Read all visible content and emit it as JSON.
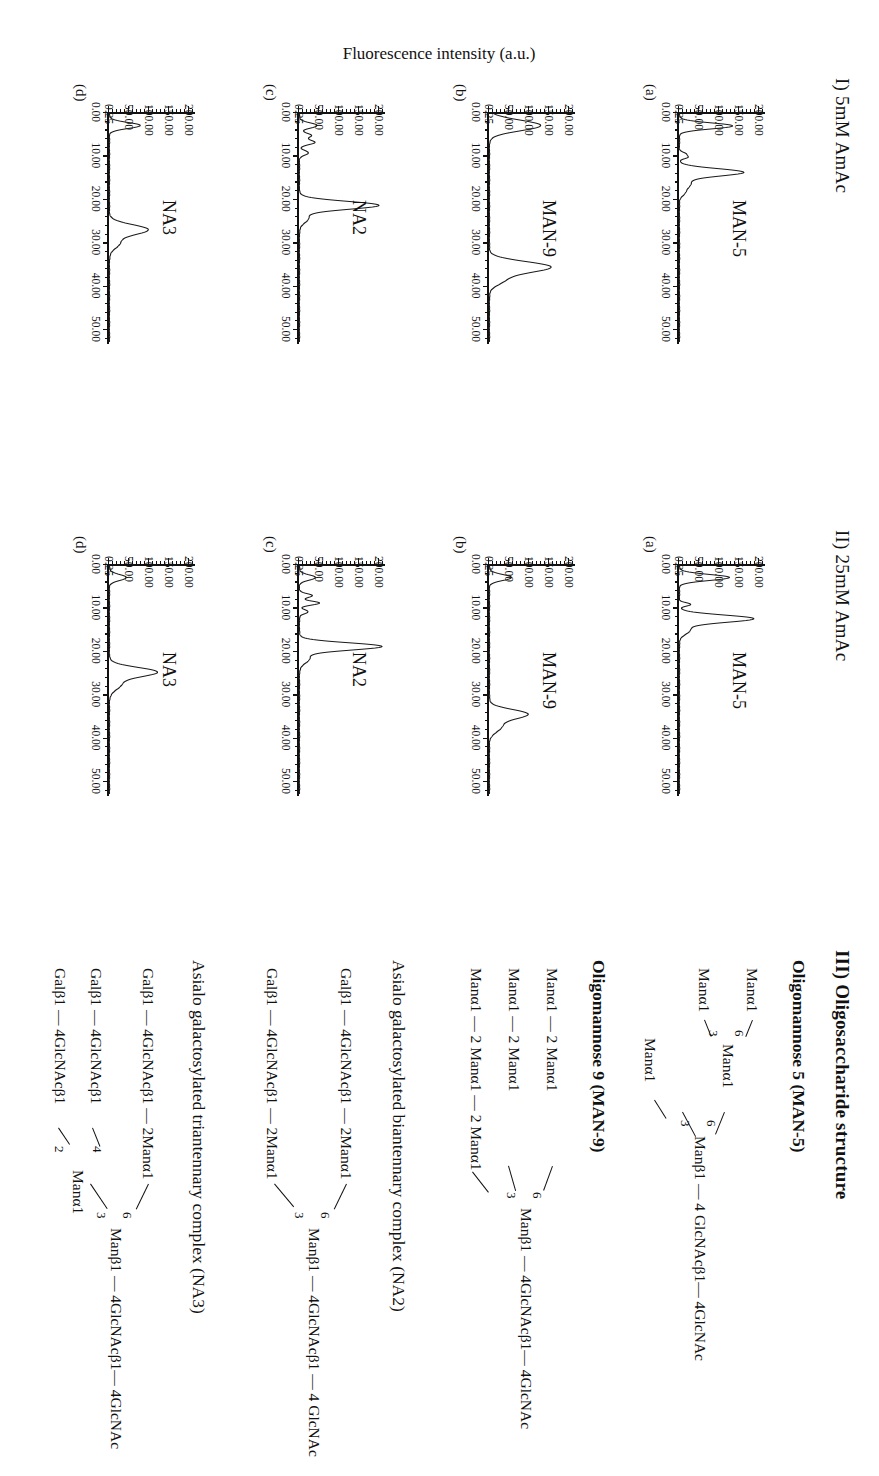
{
  "figure": {
    "y_axis_title": "Fluorescence intensity (a.u.)",
    "section_I_title": "I) 5mM AmAc",
    "section_II_title": "II) 25mM AmAc",
    "section_III_title": "III) Oligosaccharide structure"
  },
  "axes": {
    "y_ticks": [
      "0.25",
      "50.00",
      "100.00",
      "150.00",
      "200.00"
    ],
    "x_ticks": [
      "0.00",
      "10.00",
      "20.00",
      "30.00",
      "40.00",
      "50.00"
    ],
    "panel_letters": [
      "(a)",
      "(b)",
      "(c)",
      "(d)"
    ]
  },
  "chart_data": {
    "type": "line",
    "xlabel": "Retention time (min)",
    "ylabel": "Fluorescence intensity (a.u.)",
    "xlim": [
      0,
      53
    ],
    "ylim": [
      0.25,
      215
    ],
    "grid": false,
    "legend": "none",
    "panels": [
      {
        "id": "I-a",
        "section": "I) 5mM AmAc",
        "letter": "(a)",
        "sample": "MAN-5",
        "peaks": [
          {
            "time": 3.2,
            "height": 133,
            "width": 0.9
          },
          {
            "time": 9.6,
            "height": 14,
            "width": 0.5
          },
          {
            "time": 10.4,
            "height": 20,
            "width": 0.5
          },
          {
            "time": 13.9,
            "height": 160,
            "width": 1.1
          },
          {
            "time": 16.6,
            "height": 28,
            "width": 1.4
          },
          {
            "time": 18.7,
            "height": 10,
            "width": 1.0
          }
        ]
      },
      {
        "id": "I-b",
        "section": "I) 5mM AmAc",
        "letter": "(b)",
        "sample": "MAN-9",
        "peaks": [
          {
            "time": 3.1,
            "height": 128,
            "width": 1.6
          },
          {
            "time": 35.7,
            "height": 152,
            "width": 1.6
          },
          {
            "time": 38.6,
            "height": 36,
            "width": 1.6
          }
        ]
      },
      {
        "id": "I-c",
        "section": "I) 5mM AmAc",
        "letter": "(c)",
        "sample": "NA2",
        "peaks": [
          {
            "time": 3.1,
            "height": 44,
            "width": 0.8
          },
          {
            "time": 5.4,
            "height": 30,
            "width": 0.7
          },
          {
            "time": 7.0,
            "height": 38,
            "width": 0.7
          },
          {
            "time": 9.4,
            "height": 22,
            "width": 0.7
          },
          {
            "time": 21.5,
            "height": 198,
            "width": 1.2
          },
          {
            "time": 24.5,
            "height": 22,
            "width": 1.4
          }
        ]
      },
      {
        "id": "I-d",
        "section": "I) 5mM AmAc",
        "letter": "(d)",
        "sample": "NA3",
        "peaks": [
          {
            "time": 3.1,
            "height": 77,
            "width": 0.9
          },
          {
            "time": 27.1,
            "height": 96,
            "width": 1.5
          },
          {
            "time": 30.2,
            "height": 25,
            "width": 1.6
          }
        ]
      },
      {
        "id": "II-a",
        "section": "II) 25mM AmAc",
        "letter": "(a)",
        "sample": "MAN-5",
        "peaks": [
          {
            "time": 3.1,
            "height": 125,
            "width": 0.9
          },
          {
            "time": 9.3,
            "height": 28,
            "width": 0.5
          },
          {
            "time": 12.6,
            "height": 185,
            "width": 1.1
          },
          {
            "time": 15.2,
            "height": 26,
            "width": 1.3
          }
        ]
      },
      {
        "id": "II-b",
        "section": "II) 25mM AmAc",
        "letter": "(b)",
        "sample": "MAN-9",
        "peaks": [
          {
            "time": 3.1,
            "height": 55,
            "width": 0.9
          },
          {
            "time": 34.6,
            "height": 95,
            "width": 1.4
          },
          {
            "time": 37.5,
            "height": 30,
            "width": 1.6
          }
        ]
      },
      {
        "id": "II-c",
        "section": "II) 25mM AmAc",
        "letter": "(c)",
        "sample": "NA2",
        "peaks": [
          {
            "time": 3.1,
            "height": 40,
            "width": 0.8
          },
          {
            "time": 7.3,
            "height": 32,
            "width": 0.6
          },
          {
            "time": 9.0,
            "height": 50,
            "width": 0.6
          },
          {
            "time": 11.0,
            "height": 22,
            "width": 0.6
          },
          {
            "time": 19.0,
            "height": 205,
            "width": 1.1
          },
          {
            "time": 21.8,
            "height": 25,
            "width": 1.4
          }
        ]
      },
      {
        "id": "II-d",
        "section": "II) 25mM AmAc",
        "letter": "(d)",
        "sample": "NA3",
        "peaks": [
          {
            "time": 3.1,
            "height": 42,
            "width": 0.9
          },
          {
            "time": 24.9,
            "height": 118,
            "width": 1.4
          },
          {
            "time": 27.8,
            "height": 28,
            "width": 1.6
          }
        ]
      }
    ]
  },
  "structures": [
    {
      "title": "Oligomannose 5 (MAN-5)",
      "core": "Manβ1 — 4 GlcNAcβ1— 4GlcNAc",
      "branch_labels": [
        "6",
        "3"
      ],
      "arms": [
        "Manα1",
        "Manα1",
        "Manα1",
        "Manα1"
      ],
      "inner_node": "Manα1",
      "inner_labels": [
        "6",
        "3"
      ]
    },
    {
      "title": "Oligomannose 9 (MAN-9)",
      "core": "Manβ1 — 4GlcNAcβ1— 4GlcNAc",
      "branch_labels": [
        "6",
        "3"
      ],
      "rows": [
        "Manα1 — 2 Manα1",
        "Manα1 — 2 Manα1",
        "Manα1 — 2 Manα1 — 2 Manα1"
      ]
    },
    {
      "title": "Asialo galactosylated biantennary complex (NA2)",
      "core": "Manβ1 — 4GlcNAcβ1 — 4 GlcNAc",
      "branch_labels": [
        "6",
        "3"
      ],
      "rows": [
        "Galβ1 — 4GlcNAcβ1  —  2Manα1",
        "Galβ1 — 4GlcNAcβ1  —  2Manα1"
      ]
    },
    {
      "title": "Asialo galactosylated triantennary complex (NA3)",
      "core": "Manβ1 — 4GlcNAcβ1— 4GlcNAc",
      "branch_labels": [
        "6",
        "3"
      ],
      "sub_labels": [
        "4",
        "2"
      ],
      "rows": [
        "Galβ1 — 4GlcNAcβ1  —  2Manα1",
        "Galβ1 — 4GlcNAcβ1",
        "Galβ1 — 4GlcNAcβ1"
      ],
      "sub_node": "Manα1"
    }
  ]
}
